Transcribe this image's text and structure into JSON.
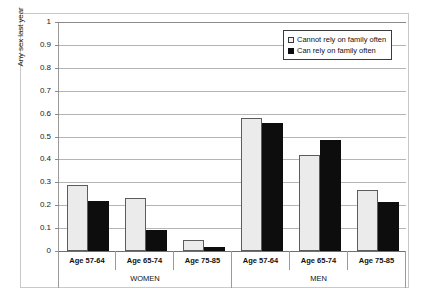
{
  "chart_data": {
    "type": "bar",
    "title": "",
    "xlabel": "",
    "ylabel": "Any sex last year",
    "ylim": [
      0,
      1
    ],
    "ytick_values": [
      0,
      0.1,
      0.2,
      0.3,
      0.4,
      0.5,
      0.6,
      0.7,
      0.8,
      0.9,
      1
    ],
    "ytick_labels": [
      "0",
      "0.1",
      "0.2",
      "0.3",
      "0.4",
      "0.5",
      "0.6",
      "0.7",
      "0.8",
      "0.9",
      "1"
    ],
    "grid": true,
    "legend_position": "top-right",
    "categories": [
      "Age 57-64",
      "Age 65-74",
      "Age 75-85",
      "Age 57-64",
      "Age 65-74",
      "Age 75-85"
    ],
    "groups": [
      {
        "label": "WOMEN",
        "categories": [
          "Age 57-64",
          "Age 65-74",
          "Age 75-85"
        ]
      },
      {
        "label": "MEN",
        "categories": [
          "Age 57-64",
          "Age 65-74",
          "Age 75-85"
        ]
      }
    ],
    "series": [
      {
        "name": "Cannot rely on family often",
        "color": "#ebebeb",
        "values": [
          0.29,
          0.23,
          0.047,
          0.58,
          0.42,
          0.265
        ]
      },
      {
        "name": "Can rely on family often",
        "color": "#0d0d0d",
        "values": [
          0.22,
          0.093,
          0.017,
          0.56,
          0.483,
          0.212
        ]
      }
    ]
  },
  "legend": {
    "entries": [
      {
        "label": "Cannot rely on family often",
        "swatch": "light"
      },
      {
        "label": "Can rely on family often",
        "swatch": "dark"
      }
    ]
  },
  "axes": {
    "y_title": "Any sex last year"
  }
}
